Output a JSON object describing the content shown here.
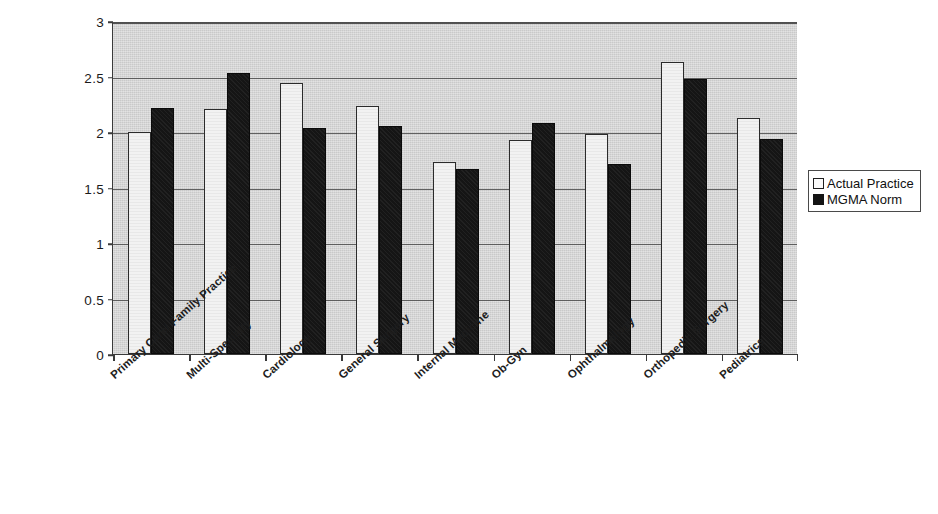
{
  "chart_data": {
    "type": "bar",
    "title": "",
    "subtitle": "",
    "xlabel": "",
    "ylabel": "",
    "ylim": [
      0,
      3
    ],
    "yticks": [
      "0",
      "0.5",
      "1",
      "1.5",
      "2",
      "2.5",
      "3"
    ],
    "grid": true,
    "legend_position": "right",
    "categories": [
      "Primary Care/ Family Practice",
      "Multi-Specialty",
      "Cardiology",
      "General Surgery",
      "Internal Medicine",
      "Ob-Gyn",
      "Ophthalmology",
      "Orthopedic Surgery",
      "Pediatrics"
    ],
    "series": [
      {
        "name": "Actual Practice",
        "color": "#f2f2f2",
        "values": [
          2.0,
          2.21,
          2.44,
          2.23,
          1.73,
          1.93,
          1.98,
          2.63,
          2.13
        ]
      },
      {
        "name": "MGMA Norm",
        "color": "#151515",
        "values": [
          2.22,
          2.53,
          2.04,
          2.05,
          1.67,
          2.08,
          1.71,
          2.48,
          1.94
        ]
      }
    ]
  },
  "legend": {
    "entries": [
      {
        "label": "Actual Practice"
      },
      {
        "label": "MGMA Norm"
      }
    ]
  },
  "colors": {
    "plot_background": "#c9c9c9",
    "axis": "#3a3a3a",
    "gridline": "#4a4a4a",
    "actual_practice": "#f2f2f2",
    "mgma_norm": "#151515"
  }
}
